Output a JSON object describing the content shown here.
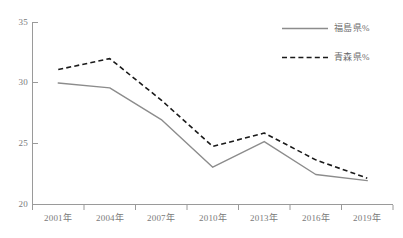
{
  "chart_data": {
    "type": "line",
    "title": "",
    "subtitle": "",
    "xlabel": "",
    "ylabel": "",
    "categories": [
      "2001年",
      "2004年",
      "2007年",
      "2010年",
      "2013年",
      "2016年",
      "2019年"
    ],
    "series": [
      {
        "name": "福島県%",
        "values": [
          30.0,
          29.6,
          27.0,
          23.1,
          25.2,
          22.5,
          22.0
        ],
        "style": "solid",
        "color": "#8c8c8c"
      },
      {
        "name": "青森県%",
        "values": [
          31.1,
          32.0,
          28.6,
          24.8,
          25.9,
          23.7,
          22.2
        ],
        "style": "dashed",
        "color": "#1a1a1a"
      }
    ],
    "ylim": [
      20,
      35
    ],
    "yticks": [
      20,
      25,
      30,
      35
    ],
    "ytick_labels": [
      "20",
      "25",
      "30",
      "35"
    ],
    "grid": false,
    "legend_position": "top-right",
    "axis_color": "#9a9a9a",
    "background_color": "#ffffff"
  },
  "legend": {
    "entries": [
      {
        "label": "福島県%"
      },
      {
        "label": "青森県%"
      }
    ]
  },
  "axes": {
    "y_labels": [
      "35",
      "30",
      "25",
      "20"
    ],
    "x_labels": [
      "2001年",
      "2004年",
      "2007年",
      "2010年",
      "2013年",
      "2016年",
      "2019年"
    ]
  }
}
